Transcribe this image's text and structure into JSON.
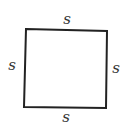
{
  "diagram": {
    "shape": "square",
    "stroke_color": "#222222",
    "labels": {
      "top": "s",
      "left": "s",
      "right": "s",
      "bottom": "s"
    }
  }
}
